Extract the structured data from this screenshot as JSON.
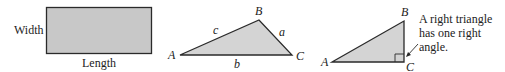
{
  "rectangle": {
    "width_label": "Width",
    "length_label": "Length",
    "fill": "#c8c8c8",
    "stroke": "#2a2a2a"
  },
  "triangle1": {
    "vertices": {
      "A": "A",
      "B": "B",
      "C": "C"
    },
    "sides": {
      "a": "a",
      "b": "b",
      "c": "c"
    },
    "fill": "#d4d4d4"
  },
  "triangle2": {
    "vertices": {
      "A": "A",
      "B": "B",
      "C": "C"
    },
    "annotation_lines": [
      "A right triangle",
      "has one right",
      "angle."
    ],
    "fill": "#d4d4d4"
  }
}
